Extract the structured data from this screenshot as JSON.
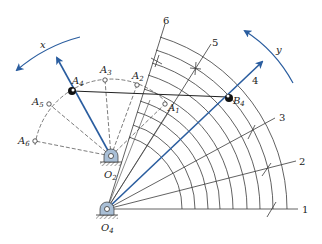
{
  "figure": {
    "type": "mechanism-construction-diagram",
    "colors": {
      "link_blue": "#2a5d9f",
      "line_gray": "#3a3a3a",
      "pivot_fill": "#a9bfd6",
      "ground_hatch": "#555555"
    },
    "pivots": [
      {
        "id": "O2",
        "label": "O",
        "sub": "2"
      },
      {
        "id": "O4",
        "label": "O",
        "sub": "4"
      }
    ],
    "points": [
      {
        "id": "A1",
        "label": "A",
        "sub": "1"
      },
      {
        "id": "A2",
        "label": "A",
        "sub": "2"
      },
      {
        "id": "A3",
        "label": "A",
        "sub": "3"
      },
      {
        "id": "A4",
        "label": "A",
        "sub": "4"
      },
      {
        "id": "A5",
        "label": "A",
        "sub": "5"
      },
      {
        "id": "A6",
        "label": "A",
        "sub": "6"
      },
      {
        "id": "B4",
        "label": "B",
        "sub": "4"
      }
    ],
    "rays": [
      {
        "id": "1",
        "label": "1"
      },
      {
        "id": "2",
        "label": "2"
      },
      {
        "id": "3",
        "label": "3"
      },
      {
        "id": "4",
        "label": "4"
      },
      {
        "id": "5",
        "label": "5"
      },
      {
        "id": "6",
        "label": "6"
      }
    ],
    "rotation_arrows": [
      {
        "id": "x",
        "label": "x"
      },
      {
        "id": "y",
        "label": "y"
      }
    ]
  }
}
